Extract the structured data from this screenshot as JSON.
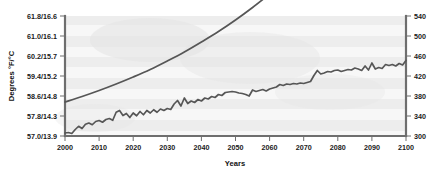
{
  "chart_data": {
    "type": "line",
    "title": "",
    "xlabel": "Years",
    "ylabel": "Degrees °F/°C",
    "y2label": "",
    "xlim": [
      2000,
      2100
    ],
    "ylim": [
      57.0,
      61.8
    ],
    "y2lim": [
      300,
      540
    ],
    "grid": false,
    "legend": "none",
    "x_ticks": [
      "2000",
      "2010",
      "2020",
      "2030",
      "2040",
      "2050",
      "2060",
      "2070",
      "2080",
      "2090",
      "2100"
    ],
    "y_ticks": [
      "57.0/13.9",
      "57.8/14.3",
      "58.6/14.8",
      "59.4/15.2",
      "60.2/15.7",
      "61.0/16.1",
      "61.8/16.6"
    ],
    "y2_ticks": [
      "300",
      "340",
      "380",
      "420",
      "460",
      "500",
      "540"
    ],
    "series": [
      {
        "name": "CO2 concentration (ppm)",
        "axis": "right",
        "style": "smooth",
        "color": "#565656",
        "x": [
          2000,
          2005,
          2010,
          2015,
          2020,
          2025,
          2030,
          2035,
          2040,
          2045,
          2050,
          2055,
          2060,
          2065,
          2068
        ],
        "values": [
          368,
          379,
          391,
          404,
          418,
          433,
          450,
          468,
          488,
          509,
          532,
          557,
          584,
          612,
          632
        ]
      },
      {
        "name": "Global mean temperature",
        "axis": "left",
        "style": "jagged",
        "color": "#565656",
        "x": [
          2000,
          2001,
          2002,
          2003,
          2004,
          2005,
          2006,
          2007,
          2008,
          2009,
          2010,
          2011,
          2012,
          2013,
          2014,
          2015,
          2016,
          2017,
          2018,
          2019,
          2020,
          2021,
          2022,
          2023,
          2024,
          2025,
          2026,
          2027,
          2028,
          2029,
          2030,
          2031,
          2032,
          2033,
          2034,
          2035,
          2036,
          2037,
          2038,
          2039,
          2040,
          2041,
          2042,
          2043,
          2044,
          2045,
          2046,
          2047,
          2048,
          2049,
          2050,
          2051,
          2052,
          2053,
          2054,
          2055,
          2056,
          2057,
          2058,
          2059,
          2060,
          2061,
          2062,
          2063,
          2064,
          2065,
          2066,
          2067,
          2068,
          2069,
          2070,
          2071,
          2072,
          2073,
          2074,
          2075,
          2076,
          2077,
          2078,
          2079,
          2080,
          2081,
          2082,
          2083,
          2084,
          2085,
          2086,
          2087,
          2088,
          2089,
          2090,
          2091,
          2092,
          2093,
          2094,
          2095,
          2096,
          2097,
          2098,
          2099,
          2100
        ],
        "values": [
          57.12,
          57.14,
          57.1,
          57.26,
          57.39,
          57.3,
          57.47,
          57.52,
          57.45,
          57.58,
          57.62,
          57.55,
          57.66,
          57.7,
          57.63,
          57.95,
          58.02,
          57.82,
          57.9,
          57.74,
          57.92,
          57.81,
          57.98,
          57.85,
          58.02,
          57.92,
          58.05,
          57.95,
          58.08,
          58.02,
          58.1,
          58.06,
          58.28,
          58.42,
          58.2,
          58.52,
          58.3,
          58.4,
          58.34,
          58.46,
          58.4,
          58.52,
          58.48,
          58.58,
          58.54,
          58.66,
          58.62,
          58.74,
          58.76,
          58.78,
          58.76,
          58.72,
          58.7,
          58.66,
          58.6,
          58.84,
          58.78,
          58.82,
          58.86,
          58.8,
          58.88,
          58.92,
          58.96,
          59.06,
          59.02,
          59.08,
          59.06,
          59.1,
          59.08,
          59.12,
          59.1,
          59.14,
          59.18,
          59.42,
          59.62,
          59.48,
          59.52,
          59.58,
          59.56,
          59.62,
          59.64,
          59.58,
          59.62,
          59.66,
          59.64,
          59.72,
          59.68,
          59.62,
          59.8,
          59.64,
          59.92,
          59.68,
          59.74,
          59.7,
          59.86,
          59.82,
          59.86,
          59.8,
          59.9,
          59.84,
          60.02
        ]
      }
    ]
  },
  "axes": {
    "x_title": "Years",
    "y_title": "Degrees °F/°C"
  },
  "colors": {
    "line": "#565656",
    "axis": "#6e6e6e",
    "text": "#1a1a1a",
    "plot_bg": "#f7f7f7",
    "band": "#ededed"
  }
}
